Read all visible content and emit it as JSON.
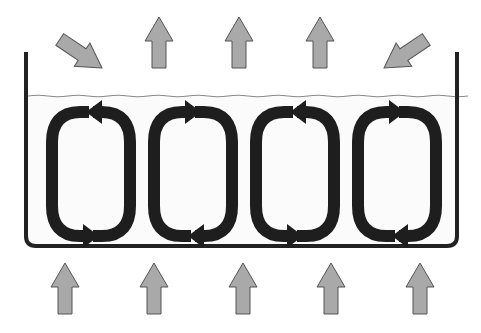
{
  "diagram": {
    "title": "",
    "colors": {
      "background": "#ffffff",
      "container_stroke": "#222222",
      "water_line": "#8a8a8a",
      "water_fill": "#fbfbfb",
      "cell_arrow": "#1e1e1e",
      "heat_arrow_fill": "#a9a9a9",
      "heat_arrow_stroke": "#555555"
    },
    "container": {
      "left": 26,
      "right": 457,
      "top": 52,
      "bottom": 246,
      "water_level": 96
    },
    "convection_cells": [
      {
        "id": 1,
        "x": 46,
        "rotation": "counterclockwise"
      },
      {
        "id": 2,
        "x": 148,
        "rotation": "clockwise"
      },
      {
        "id": 3,
        "x": 250,
        "rotation": "counterclockwise"
      },
      {
        "id": 4,
        "x": 352,
        "rotation": "clockwise"
      }
    ],
    "top_arrows": [
      {
        "id": "incoming-left",
        "direction": "down-right",
        "x": 82,
        "y": 53
      },
      {
        "id": "up-1",
        "direction": "up",
        "x": 159
      },
      {
        "id": "up-2",
        "direction": "up",
        "x": 239
      },
      {
        "id": "up-3",
        "direction": "up",
        "x": 320
      },
      {
        "id": "incoming-right",
        "direction": "down-left",
        "x": 406,
        "y": 53
      }
    ],
    "bottom_arrows": [
      {
        "id": "heat-1",
        "direction": "up",
        "x": 65
      },
      {
        "id": "heat-2",
        "direction": "up",
        "x": 154
      },
      {
        "id": "heat-3",
        "direction": "up",
        "x": 243
      },
      {
        "id": "heat-4",
        "direction": "up",
        "x": 331
      },
      {
        "id": "heat-5",
        "direction": "up",
        "x": 420
      }
    ]
  }
}
